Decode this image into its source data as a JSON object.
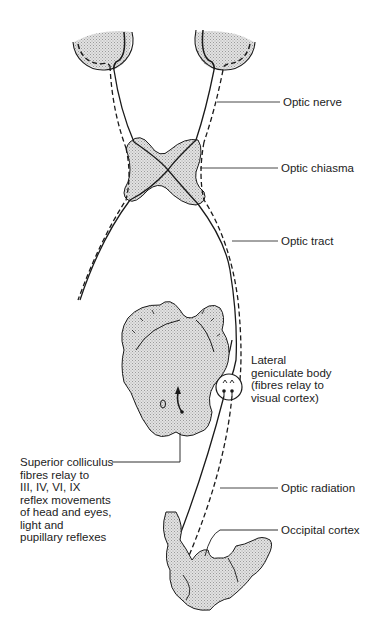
{
  "diagram": {
    "fill_color": "#d9d9d9",
    "stroke_color": "#1a1a1a",
    "labels": {
      "optic_nerve": "Optic nerve",
      "optic_chiasma": "Optic chiasma",
      "optic_tract": "Optic tract",
      "lgb_line1": "Lateral",
      "lgb_line2": "geniculate body",
      "lgb_line3": "(fibres relay to",
      "lgb_line4": "visual cortex)",
      "optic_radiation": "Optic radiation",
      "occipital_cortex": "Occipital cortex",
      "sc_line1": "Superior colliculus",
      "sc_line2": "fibres relay to",
      "sc_line3": "III, IV, VI, IX",
      "sc_line4": "reflex movements",
      "sc_line5": "of head and eyes,",
      "sc_line6": "light and",
      "sc_line7": "pupillary reflexes"
    }
  }
}
